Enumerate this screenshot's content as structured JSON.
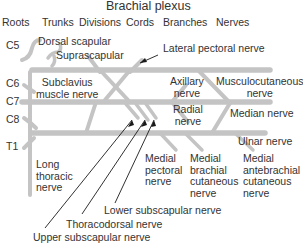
{
  "title": "Brachial plexus",
  "headers": [
    "Roots",
    "Trunks",
    "Divisions",
    "Cords",
    "Branches",
    "Nerves"
  ],
  "roots": [
    "C5",
    "C6",
    "C7",
    "C8",
    "T1"
  ],
  "labels": {
    "dorsal_scapular": "Dorsal scapular",
    "suprascapular": "Suprascapular",
    "lateral_pectoral": "Lateral pectoral nerve",
    "subclavius": "Subclavius\nmuscle nerve",
    "axillary": "Axillary\nnerve",
    "musculocutaneous": "Musculocutaneous\nnerve",
    "radial": "Radial\nnerve",
    "median": "Median nerve",
    "ulnar": "Ulnar nerve",
    "long_thoracic": "Long\nthoracic\nnerve",
    "medial_pectoral": "Medial\npectoral\nnerve",
    "medial_brachial_cutaneous": "Medial\nbrachial\ncutaneous\nnerve",
    "medial_antebrachial_cutaneous": "Medial\nantebrachial\ncutaneous\nnerve",
    "lower_subscapular": "Lower subscapular nerve",
    "thoracodorsal": "Thoracodorsal nerve",
    "upper_subscapular": "Upper subscapular nerve"
  },
  "colors": {
    "nerve_fill": "#c8c8c8",
    "nerve_edge": "#a8a8a8",
    "pointer": "#1a1a1a",
    "text": "#333333"
  }
}
